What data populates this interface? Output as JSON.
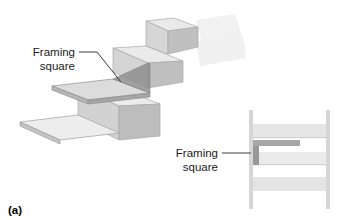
{
  "figure": {
    "caption": "(a)",
    "main_label": {
      "line1": "Framing",
      "line2": "square"
    },
    "inset_label": {
      "line1": "Framing",
      "line2": "square"
    }
  },
  "colors": {
    "background": "#ffffff",
    "step_top": "#e8e8e8",
    "step_front": "#c9c9c9",
    "step_side": "#bdbdbd",
    "step_shadow": "#9e9e9e",
    "square_blade_top": "#d8d8d8",
    "square_blade_edge": "#8c8c8c",
    "square_dark": "#9a9a9a",
    "inset_band_light": "#ededed",
    "inset_band_mid": "#dedede",
    "inset_rail": "#d2d2d2",
    "leader_line": "#3a3a3a",
    "text": "#1b1b1b"
  }
}
